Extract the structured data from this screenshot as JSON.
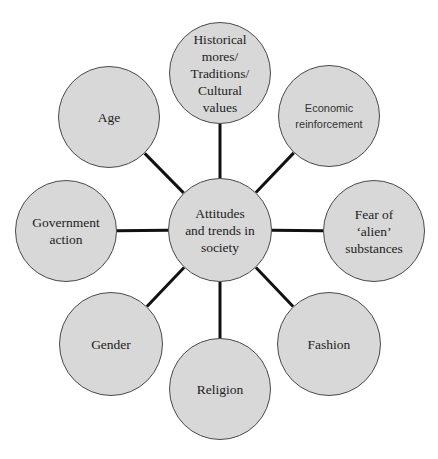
{
  "diagram": {
    "title": "Attitudes and trends in society",
    "style": {
      "node_fill": "#d8d8d8",
      "node_stroke": "#4a4a4a",
      "connector_color": "#111111",
      "background": "#ffffff"
    },
    "center": {
      "label": "Attitudes\nand trends in\nsociety",
      "cx": 220,
      "cy": 230,
      "r": 52
    },
    "nodes": [
      {
        "id": "historical",
        "label": "Historical\nmores/\nTraditions/\nCultural\nvalues",
        "cx": 220,
        "cy": 73,
        "r": 51,
        "font": "serif"
      },
      {
        "id": "economic",
        "label": "Economic\nreinforcement",
        "cx": 329,
        "cy": 116,
        "r": 51,
        "font": "sans"
      },
      {
        "id": "fear",
        "label": "Fear of\n‘alien’\nsubstances",
        "cx": 374,
        "cy": 231,
        "r": 51,
        "font": "serif"
      },
      {
        "id": "fashion",
        "label": "Fashion",
        "cx": 329,
        "cy": 344,
        "r": 52,
        "font": "serif"
      },
      {
        "id": "religion",
        "label": "Religion",
        "cx": 220,
        "cy": 389,
        "r": 51,
        "font": "serif"
      },
      {
        "id": "gender",
        "label": "Gender",
        "cx": 111,
        "cy": 344,
        "r": 52,
        "font": "serif"
      },
      {
        "id": "government",
        "label": "Government\naction",
        "cx": 66,
        "cy": 231,
        "r": 51,
        "font": "serif"
      },
      {
        "id": "age",
        "label": "Age",
        "cx": 109,
        "cy": 117,
        "r": 51,
        "font": "serif"
      }
    ]
  }
}
